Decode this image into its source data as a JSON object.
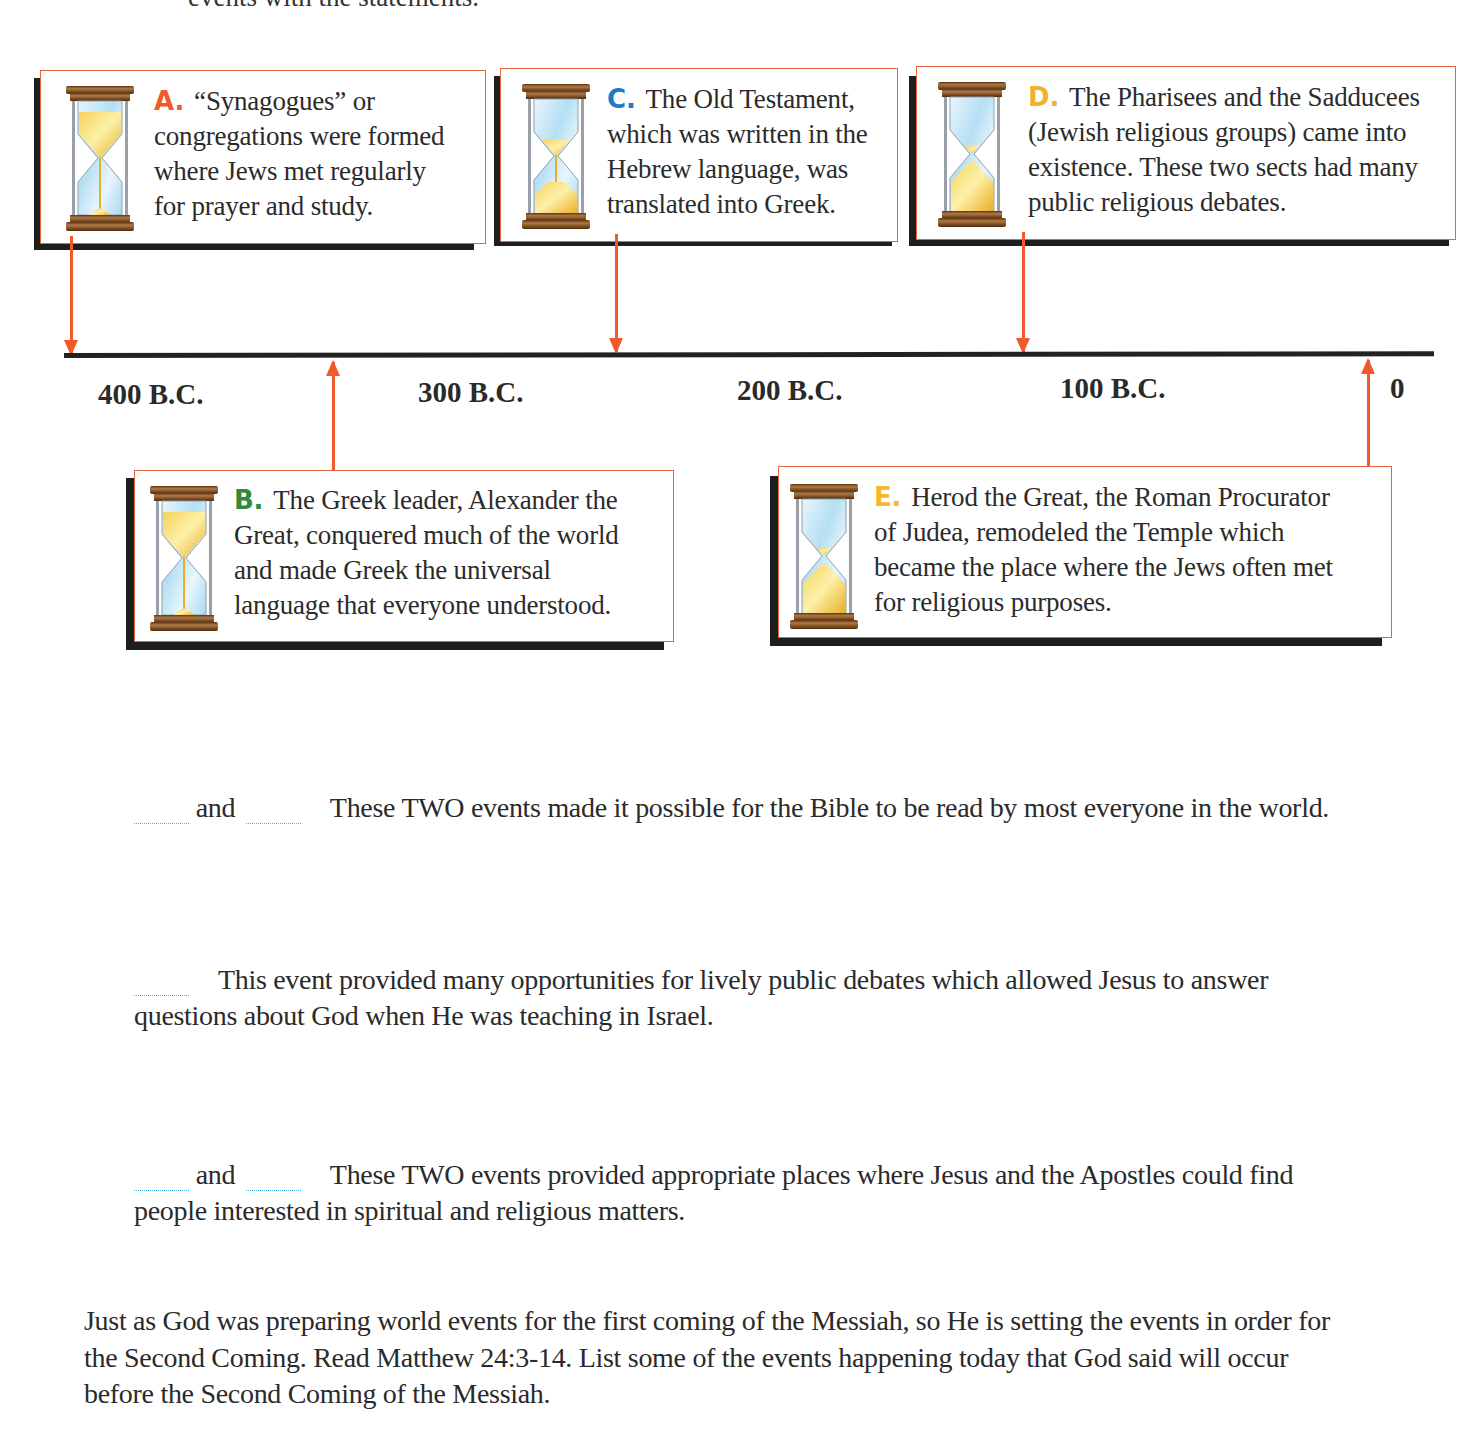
{
  "intro": {
    "fragment": "events with the statements."
  },
  "timeline": {
    "ticks": [
      {
        "label": "400 B.C.",
        "x": 98,
        "y": 378
      },
      {
        "label": "300 B.C.",
        "x": 418,
        "y": 376
      },
      {
        "label": "200 B.C.",
        "x": 737,
        "y": 374
      },
      {
        "label": "100 B.C.",
        "x": 1060,
        "y": 372
      },
      {
        "label": "0",
        "x": 1390,
        "y": 372
      }
    ]
  },
  "events": {
    "A": {
      "letter": "A.",
      "letter_color": "#f05a2a",
      "text": "“Synagogues” or congregations were formed where Jews met regularly for prayer and study.",
      "lines": [
        "“Synagogues” or",
        "congregations were formed",
        "where Jews met regularly",
        "for prayer and study."
      ]
    },
    "B": {
      "letter": "B.",
      "letter_color": "#2e8b3a",
      "lines": [
        "The Greek leader, Alexander the",
        "Great, conquered much of the world",
        "and made Greek the universal",
        "language that everyone understood."
      ]
    },
    "C": {
      "letter": "C.",
      "letter_color": "#1f78c8",
      "lines": [
        "The Old Testament,",
        "which was written in the",
        "Hebrew language, was",
        "translated into Greek."
      ]
    },
    "D": {
      "letter": "D.",
      "letter_color": "#f0b030",
      "lines": [
        "The Pharisees and the Sadducees",
        "(Jewish religious groups) came into",
        "existence.  These two sects had many",
        "public religious debates."
      ]
    },
    "E": {
      "letter": "E.",
      "letter_color": "#f5b82e",
      "lines": [
        "Herod the Great, the Roman Procurator",
        "of Judea, remodeled the Temple which",
        "became the place where the Jews often met",
        "for religious purposes."
      ]
    }
  },
  "questions": [
    {
      "connector": "and",
      "text": "These TWO events made it possible for the Bible to be read by most everyone in the world.",
      "blank_count": 2
    },
    {
      "line1": "This event provided many opportunities for lively public debates which allowed Jesus to answer",
      "line2": "questions about God when He was teaching in Israel.",
      "blank_count": 1
    },
    {
      "connector": "and",
      "line1": "These TWO events provided appropriate places where Jesus and the Apostles could find",
      "line2": "people interested in spiritual and religious matters.",
      "blank_count": 2
    }
  ],
  "closing": {
    "lines": [
      "Just as God was preparing world events for the first coming of the Messiah, so He is setting the events in order for",
      "the Second Coming.  Read Matthew 24:3-14.  List some of the events happening today that God said will occur",
      "before the Second Coming of the Messiah."
    ]
  },
  "colors": {
    "arrow": "#f05a2a",
    "card_border": "#e8643a",
    "shadow": "#1e1e1e",
    "blank_line": "#4ab0e8",
    "hourglass_wood": "#8b5a2b",
    "hourglass_sand": "#f2c84a",
    "hourglass_glass": "#bfe3f5"
  }
}
